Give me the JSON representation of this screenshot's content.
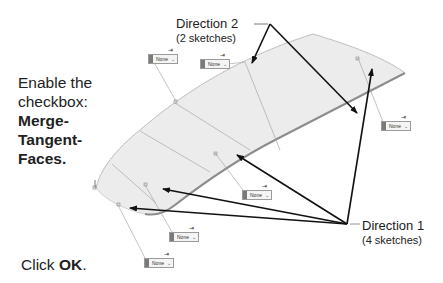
{
  "instructions": {
    "step1_line1": "Enable the",
    "step1_line2": "checkbox:",
    "step1_bold1": "Merge-",
    "step1_bold2": "Tangent-",
    "step1_bold3": "Faces.",
    "step2_prefix": "Click ",
    "step2_bold": "OK",
    "step2_suffix": "."
  },
  "callouts": {
    "direction2": {
      "title": "Direction 2",
      "subtitle": "(2 sketches)"
    },
    "direction1": {
      "title": "Direction 1",
      "subtitle": "(4 sketches)"
    }
  },
  "dropdowns": [
    {
      "value": "None",
      "chevron": "⌄",
      "pin": "⇥"
    },
    {
      "value": "None",
      "chevron": "⌄",
      "pin": "⇥"
    },
    {
      "value": "None",
      "chevron": "⌄",
      "pin": "⇥"
    },
    {
      "value": "None",
      "chevron": "⌄",
      "pin": "⇥"
    },
    {
      "value": "None",
      "chevron": "⌄",
      "pin": "⇥"
    },
    {
      "value": "None",
      "chevron": "⌄",
      "pin": "⇥"
    }
  ],
  "colors": {
    "surface_fill": "#ececec",
    "surface_edge": "#8c8c8c",
    "arrow": "#111111",
    "leader": "#9a9a9a",
    "text": "#222222"
  }
}
